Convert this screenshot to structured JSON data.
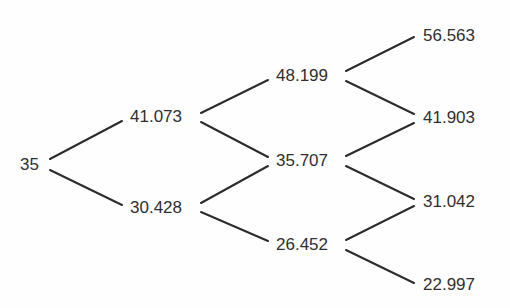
{
  "diagram": {
    "type": "binomial-tree",
    "colors": {
      "background": "#fefefe",
      "text": "#2f2f2f",
      "edge": "#2b2b2b"
    },
    "nodes": [
      {
        "id": "n0",
        "step": 0,
        "label": "35",
        "x": 20,
        "y": 165
      },
      {
        "id": "u1",
        "step": 1,
        "label": "41.073",
        "x": 130,
        "y": 117
      },
      {
        "id": "d1",
        "step": 1,
        "label": "30.428",
        "x": 130,
        "y": 208
      },
      {
        "id": "uu2",
        "step": 2,
        "label": "48.199",
        "x": 276,
        "y": 76
      },
      {
        "id": "ud2",
        "step": 2,
        "label": "35.707",
        "x": 276,
        "y": 161
      },
      {
        "id": "dd2",
        "step": 2,
        "label": "26.452",
        "x": 276,
        "y": 245
      },
      {
        "id": "uuu3",
        "step": 3,
        "label": "56.563",
        "x": 423,
        "y": 36
      },
      {
        "id": "uud3",
        "step": 3,
        "label": "41.903",
        "x": 423,
        "y": 118
      },
      {
        "id": "udd3",
        "step": 3,
        "label": "31.042",
        "x": 423,
        "y": 202
      },
      {
        "id": "ddd3",
        "step": 3,
        "label": "22.997",
        "x": 423,
        "y": 285
      }
    ],
    "edges": [
      {
        "from": "35",
        "to": "41.073",
        "x1": 50,
        "y1": 159,
        "x2": 122,
        "y2": 121
      },
      {
        "from": "35",
        "to": "30.428",
        "x1": 50,
        "y1": 170,
        "x2": 122,
        "y2": 205
      },
      {
        "from": "41.073",
        "to": "48.199",
        "x1": 201,
        "y1": 113,
        "x2": 268,
        "y2": 80
      },
      {
        "from": "41.073",
        "to": "35.707",
        "x1": 201,
        "y1": 122,
        "x2": 268,
        "y2": 157
      },
      {
        "from": "30.428",
        "to": "35.707",
        "x1": 201,
        "y1": 203,
        "x2": 268,
        "y2": 166
      },
      {
        "from": "30.428",
        "to": "26.452",
        "x1": 201,
        "y1": 212,
        "x2": 268,
        "y2": 241
      },
      {
        "from": "48.199",
        "to": "56.563",
        "x1": 346,
        "y1": 71,
        "x2": 414,
        "y2": 37
      },
      {
        "from": "48.199",
        "to": "41.903",
        "x1": 346,
        "y1": 81,
        "x2": 414,
        "y2": 114
      },
      {
        "from": "35.707",
        "to": "41.903",
        "x1": 346,
        "y1": 156,
        "x2": 414,
        "y2": 123
      },
      {
        "from": "35.707",
        "to": "31.042",
        "x1": 346,
        "y1": 166,
        "x2": 414,
        "y2": 199
      },
      {
        "from": "26.452",
        "to": "31.042",
        "x1": 346,
        "y1": 240,
        "x2": 414,
        "y2": 206
      },
      {
        "from": "26.452",
        "to": "22.997",
        "x1": 346,
        "y1": 250,
        "x2": 414,
        "y2": 283
      }
    ]
  }
}
